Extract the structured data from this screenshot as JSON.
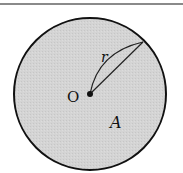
{
  "diagram": {
    "type": "circle",
    "center_label": "O",
    "radius_label": "r",
    "area_label": "A",
    "colors": {
      "fill": "#d2d2d2",
      "stroke": "#111111",
      "top_rule": "#8a8a8a"
    }
  }
}
